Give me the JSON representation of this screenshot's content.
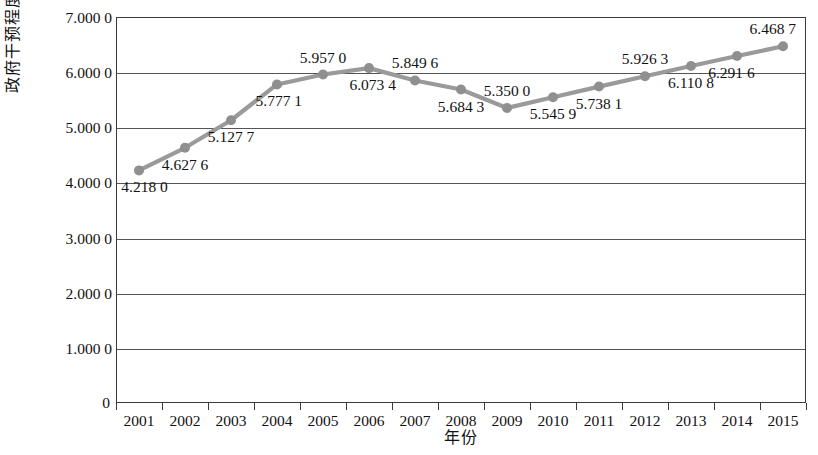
{
  "chart_data": {
    "type": "line",
    "title": "",
    "xlabel": "年份",
    "ylabel": "政府干预程度",
    "categories": [
      "2001",
      "2002",
      "2003",
      "2004",
      "2005",
      "2006",
      "2007",
      "2008",
      "2009",
      "2010",
      "2011",
      "2012",
      "2013",
      "2014",
      "2015"
    ],
    "values": [
      4.218,
      4.6276,
      5.1277,
      5.7771,
      5.957,
      6.0734,
      5.8496,
      5.6843,
      5.35,
      5.5459,
      5.7381,
      5.9263,
      6.1108,
      6.2916,
      6.4687
    ],
    "point_labels": [
      "4.218 0",
      "4.627 6",
      "5.127 7",
      "5.777 1",
      "5.957 0",
      "6.073 4",
      "5.849 6",
      "5.684 3",
      "5.350 0",
      "5.545 9",
      "5.738 1",
      "5.926 3",
      "6.110 8",
      "6.291 6",
      "6.468 7"
    ],
    "label_positions": [
      "below",
      "below",
      "below",
      "below",
      "above",
      "below",
      "above",
      "below",
      "above",
      "below",
      "below",
      "above",
      "below",
      "below",
      "above"
    ],
    "ylim": [
      0,
      7
    ],
    "ytick_values": [
      7,
      6,
      5,
      4,
      3,
      2,
      1,
      0
    ],
    "ytick_labels": [
      "7.000 0",
      "6.000 0",
      "5.000 0",
      "4.000 0",
      "3.000 0",
      "2.000 0",
      "1.000 0",
      "0"
    ],
    "grid": true,
    "legend": "none",
    "series_color": "#9a9a9a",
    "marker_color": "#8f8f8f",
    "axis_color": "#3a3a3a",
    "grid_color": "#555555",
    "background_color": "#ffffff"
  }
}
